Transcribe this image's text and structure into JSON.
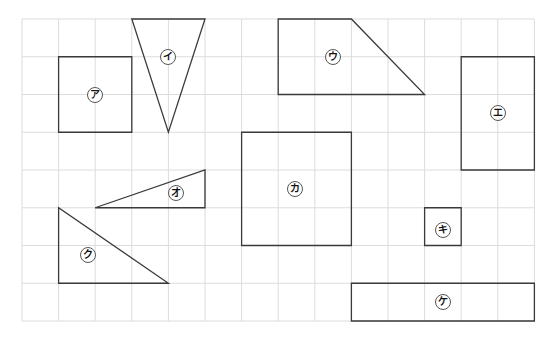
{
  "grid": {
    "origin_x": 22,
    "origin_y": 19,
    "cell_w": 36.6,
    "cell_h": 37.75,
    "cols": 14,
    "rows": 8,
    "line_color": "#dcdcdc",
    "shape_stroke": "#3a3a3a"
  },
  "shapes": [
    {
      "id": "a",
      "label": "ア",
      "type": "rectangle",
      "points": [
        [
          1,
          1
        ],
        [
          3,
          1
        ],
        [
          3,
          3
        ],
        [
          1,
          3
        ]
      ],
      "label_pos": [
        2,
        2
      ]
    },
    {
      "id": "i",
      "label": "イ",
      "type": "triangle",
      "points": [
        [
          3,
          0
        ],
        [
          5,
          0
        ],
        [
          4,
          3
        ]
      ],
      "label_pos": [
        4,
        1
      ]
    },
    {
      "id": "u",
      "label": "ウ",
      "type": "trapezoid",
      "points": [
        [
          7,
          0
        ],
        [
          9,
          0
        ],
        [
          11,
          2
        ],
        [
          7,
          2
        ]
      ],
      "label_pos": [
        8.5,
        1
      ]
    },
    {
      "id": "e",
      "label": "エ",
      "type": "rectangle",
      "points": [
        [
          12,
          1
        ],
        [
          14,
          1
        ],
        [
          14,
          4
        ],
        [
          12,
          4
        ]
      ],
      "label_pos": [
        13,
        2.5
      ]
    },
    {
      "id": "o",
      "label": "オ",
      "type": "triangle",
      "points": [
        [
          2,
          5
        ],
        [
          5,
          4
        ],
        [
          5,
          5
        ]
      ],
      "label_pos": [
        4.2,
        4.6
      ]
    },
    {
      "id": "ka",
      "label": "カ",
      "type": "square",
      "points": [
        [
          6,
          3
        ],
        [
          9,
          3
        ],
        [
          9,
          6
        ],
        [
          6,
          6
        ]
      ],
      "label_pos": [
        7.45,
        4.5
      ]
    },
    {
      "id": "ki",
      "label": "キ",
      "type": "square",
      "points": [
        [
          11,
          5
        ],
        [
          12,
          5
        ],
        [
          12,
          6
        ],
        [
          11,
          6
        ]
      ],
      "label_pos": [
        11.5,
        5.6
      ]
    },
    {
      "id": "ku",
      "label": "ク",
      "type": "triangle",
      "points": [
        [
          1,
          5
        ],
        [
          1,
          7
        ],
        [
          4,
          7
        ]
      ],
      "label_pos": [
        1.8,
        6.25
      ]
    },
    {
      "id": "ke",
      "label": "ケ",
      "type": "rectangle",
      "points": [
        [
          9,
          7
        ],
        [
          14,
          7
        ],
        [
          14,
          8
        ],
        [
          9,
          8
        ]
      ],
      "label_pos": [
        11.5,
        7.5
      ]
    }
  ]
}
